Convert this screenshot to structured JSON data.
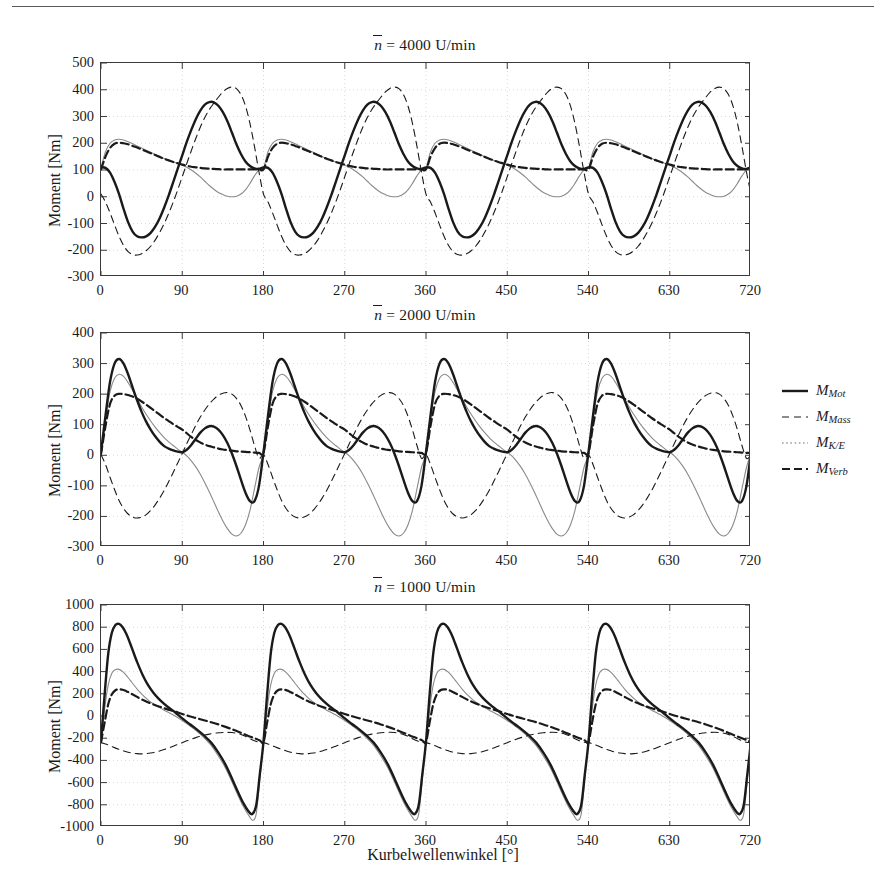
{
  "figure": {
    "x_axis_label": "Kurbelwellenwinkel [°]",
    "y_axis_label": "Moment [Nm]"
  },
  "legend": {
    "position": "right-middle",
    "entries": [
      {
        "name": "M_Mot",
        "base": "M",
        "sub": "Mot",
        "style": "solid",
        "color": "#1a1a1a",
        "width": 2.4
      },
      {
        "name": "M_Mass",
        "base": "M",
        "sub": "Mass",
        "style": "dashed",
        "color": "#1a1a1a",
        "width": 1.1
      },
      {
        "name": "M_K/E",
        "base": "M",
        "sub": "K/E",
        "style": "dotted",
        "color": "#6e6e6e",
        "width": 1.1
      },
      {
        "name": "M_Verb",
        "base": "M",
        "sub": "Verb",
        "style": "dashdot",
        "color": "#1a1a1a",
        "width": 2.2
      }
    ]
  },
  "chart_data": [
    {
      "id": "panel-4000",
      "type": "line",
      "title": "n̄ = 4000 U/min",
      "title_prefix": "n",
      "title_suffix": "= 4000 U/min",
      "speed_rpm": 4000,
      "xlabel": "Kurbelwellenwinkel [°]",
      "ylabel": "Moment [Nm]",
      "xlim": [
        0,
        720
      ],
      "ylim": [
        -300,
        500
      ],
      "xticks": [
        0,
        90,
        180,
        270,
        360,
        450,
        540,
        630,
        720
      ],
      "yticks": [
        -300,
        -200,
        -100,
        0,
        100,
        200,
        300,
        400,
        500
      ],
      "grid": true,
      "period_deg": 180,
      "series": [
        {
          "name": "M_Mot",
          "style": "solid",
          "color": "#1a1a1a",
          "width": 2.4,
          "x": [
            0,
            5,
            10,
            15,
            20,
            25,
            30,
            35,
            40,
            45,
            50,
            55,
            60,
            65,
            70,
            75,
            80,
            85,
            90,
            95,
            100,
            105,
            110,
            115,
            120,
            125,
            130,
            135,
            140,
            145,
            150,
            155,
            160,
            165,
            170,
            175,
            180
          ],
          "y": [
            110,
            108,
            90,
            55,
            10,
            -45,
            -95,
            -130,
            -148,
            -152,
            -148,
            -135,
            -112,
            -80,
            -40,
            5,
            55,
            105,
            155,
            205,
            250,
            290,
            322,
            344,
            354,
            353,
            340,
            316,
            282,
            240,
            196,
            160,
            132,
            115,
            106,
            104,
            110
          ]
        },
        {
          "name": "M_Mass",
          "style": "dashed",
          "color": "#1a1a1a",
          "width": 1.1,
          "x": [
            0,
            5,
            10,
            15,
            20,
            25,
            30,
            35,
            40,
            45,
            50,
            55,
            60,
            65,
            70,
            75,
            80,
            85,
            90,
            95,
            100,
            105,
            110,
            115,
            120,
            125,
            130,
            135,
            140,
            145,
            150,
            155,
            160,
            165,
            170,
            175,
            180
          ],
          "y": [
            10,
            -20,
            -60,
            -105,
            -148,
            -182,
            -205,
            -216,
            -218,
            -213,
            -202,
            -185,
            -162,
            -133,
            -100,
            -62,
            -20,
            26,
            75,
            124,
            172,
            218,
            260,
            296,
            326,
            350,
            372,
            392,
            405,
            410,
            404,
            382,
            340,
            274,
            188,
            92,
            10
          ]
        },
        {
          "name": "M_K/E",
          "style": "thin-solid",
          "color": "#8a8a8a",
          "width": 1.1,
          "x": [
            0,
            5,
            10,
            15,
            20,
            25,
            30,
            35,
            40,
            45,
            50,
            55,
            60,
            65,
            70,
            75,
            80,
            85,
            90,
            95,
            100,
            105,
            110,
            115,
            120,
            125,
            130,
            135,
            140,
            145,
            150,
            155,
            160,
            165,
            170,
            175,
            180
          ],
          "y": [
            108,
            168,
            200,
            212,
            215,
            212,
            206,
            198,
            190,
            182,
            174,
            166,
            158,
            150,
            143,
            136,
            130,
            124,
            118,
            110,
            100,
            88,
            74,
            58,
            42,
            28,
            16,
            8,
            2,
            0,
            2,
            10,
            26,
            50,
            78,
            100,
            108
          ]
        },
        {
          "name": "M_Verb",
          "style": "dashdot",
          "color": "#1a1a1a",
          "width": 2.2,
          "x": [
            0,
            5,
            10,
            15,
            20,
            25,
            30,
            35,
            40,
            45,
            50,
            55,
            60,
            65,
            70,
            75,
            80,
            85,
            90,
            95,
            100,
            105,
            110,
            115,
            120,
            125,
            130,
            135,
            140,
            145,
            150,
            155,
            160,
            165,
            170,
            175,
            180
          ],
          "y": [
            102,
            150,
            182,
            198,
            202,
            200,
            196,
            190,
            184,
            177,
            170,
            163,
            156,
            149,
            142,
            136,
            130,
            125,
            120,
            116,
            112,
            110,
            108,
            106,
            105,
            104,
            103,
            102,
            102,
            102,
            102,
            102,
            102,
            102,
            102,
            102,
            102
          ]
        }
      ]
    },
    {
      "id": "panel-2000",
      "type": "line",
      "title": "n̄ = 2000 U/min",
      "title_prefix": "n",
      "title_suffix": "= 2000 U/min",
      "speed_rpm": 2000,
      "xlabel": "Kurbelwellenwinkel [°]",
      "ylabel": "Moment [Nm]",
      "xlim": [
        0,
        720
      ],
      "ylim": [
        -300,
        400
      ],
      "xticks": [
        0,
        90,
        180,
        270,
        360,
        450,
        540,
        630,
        720
      ],
      "yticks": [
        -300,
        -200,
        -100,
        0,
        100,
        200,
        300,
        400
      ],
      "grid": true,
      "period_deg": 180,
      "series": [
        {
          "name": "M_Mot",
          "style": "solid",
          "color": "#1a1a1a",
          "width": 2.4,
          "x": [
            0,
            5,
            10,
            15,
            20,
            25,
            30,
            35,
            40,
            45,
            50,
            55,
            60,
            65,
            70,
            75,
            80,
            85,
            90,
            95,
            100,
            105,
            110,
            115,
            120,
            125,
            130,
            135,
            140,
            145,
            150,
            155,
            160,
            165,
            170,
            175,
            180
          ],
          "y": [
            10,
            130,
            240,
            300,
            315,
            300,
            265,
            222,
            180,
            142,
            110,
            84,
            62,
            44,
            30,
            22,
            16,
            12,
            10,
            18,
            34,
            54,
            74,
            88,
            95,
            94,
            84,
            66,
            40,
            6,
            -35,
            -80,
            -122,
            -150,
            -150,
            -100,
            10
          ]
        },
        {
          "name": "M_Mass",
          "style": "dashed",
          "color": "#1a1a1a",
          "width": 1.1,
          "x": [
            0,
            5,
            10,
            15,
            20,
            25,
            30,
            35,
            40,
            45,
            50,
            55,
            60,
            65,
            70,
            75,
            80,
            85,
            90,
            95,
            100,
            105,
            110,
            115,
            120,
            125,
            130,
            135,
            140,
            145,
            150,
            155,
            160,
            165,
            170,
            175,
            180
          ],
          "y": [
            2,
            -30,
            -72,
            -112,
            -148,
            -174,
            -192,
            -202,
            -205,
            -202,
            -194,
            -180,
            -162,
            -140,
            -115,
            -86,
            -56,
            -25,
            6,
            38,
            68,
            98,
            125,
            148,
            168,
            184,
            196,
            203,
            205,
            200,
            186,
            163,
            128,
            83,
            32,
            -10,
            2
          ]
        },
        {
          "name": "M_K/E",
          "style": "thin-solid",
          "color": "#8a8a8a",
          "width": 1.1,
          "x": [
            0,
            5,
            10,
            15,
            20,
            25,
            30,
            35,
            40,
            45,
            50,
            55,
            60,
            65,
            70,
            75,
            80,
            85,
            90,
            95,
            100,
            105,
            110,
            115,
            120,
            125,
            130,
            135,
            140,
            145,
            150,
            155,
            160,
            165,
            170,
            175,
            180
          ],
          "y": [
            6,
            118,
            208,
            252,
            265,
            258,
            238,
            212,
            185,
            158,
            134,
            112,
            92,
            74,
            58,
            44,
            32,
            20,
            10,
            -2,
            -18,
            -38,
            -62,
            -90,
            -120,
            -152,
            -185,
            -215,
            -240,
            -258,
            -264,
            -255,
            -228,
            -180,
            -110,
            -40,
            6
          ]
        },
        {
          "name": "M_Verb",
          "style": "dashdot",
          "color": "#1a1a1a",
          "width": 2.2,
          "x": [
            0,
            5,
            10,
            15,
            20,
            25,
            30,
            35,
            40,
            45,
            50,
            55,
            60,
            65,
            70,
            75,
            80,
            85,
            90,
            95,
            100,
            105,
            110,
            115,
            120,
            125,
            130,
            135,
            140,
            145,
            150,
            155,
            160,
            165,
            170,
            175,
            180
          ],
          "y": [
            4,
            96,
            168,
            195,
            201,
            200,
            197,
            192,
            185,
            176,
            166,
            155,
            144,
            133,
            122,
            112,
            102,
            93,
            84,
            72,
            60,
            50,
            42,
            35,
            30,
            26,
            22,
            19,
            17,
            15,
            13,
            12,
            11,
            10,
            9,
            8,
            8
          ]
        }
      ]
    },
    {
      "id": "panel-1000",
      "type": "line",
      "title": "n̄ = 1000 U/min",
      "title_prefix": "n",
      "title_suffix": "= 1000 U/min",
      "speed_rpm": 1000,
      "xlabel": "Kurbelwellenwinkel [°]",
      "ylabel": "Moment [Nm]",
      "xlim": [
        0,
        720
      ],
      "ylim": [
        -1000,
        1000
      ],
      "xticks": [
        0,
        90,
        180,
        270,
        360,
        450,
        540,
        630,
        720
      ],
      "yticks": [
        -1000,
        -800,
        -600,
        -400,
        -200,
        0,
        200,
        400,
        600,
        800,
        1000
      ],
      "grid": true,
      "period_deg": 180,
      "series": [
        {
          "name": "M_Mot",
          "style": "solid",
          "color": "#1a1a1a",
          "width": 2.4,
          "x": [
            0,
            4,
            8,
            12,
            16,
            20,
            24,
            28,
            32,
            36,
            40,
            46,
            52,
            58,
            64,
            70,
            76,
            82,
            90,
            98,
            106,
            114,
            122,
            130,
            138,
            146,
            152,
            158,
            164,
            168,
            172,
            176,
            180
          ],
          "y": [
            -230,
            190,
            560,
            750,
            820,
            830,
            800,
            740,
            660,
            572,
            486,
            372,
            280,
            210,
            155,
            110,
            70,
            34,
            -22,
            -72,
            -120,
            -175,
            -240,
            -330,
            -440,
            -580,
            -690,
            -790,
            -865,
            -880,
            -800,
            -520,
            -230
          ]
        },
        {
          "name": "M_Mass",
          "style": "dashed",
          "color": "#1a1a1a",
          "width": 1.1,
          "x": [
            0,
            5,
            10,
            15,
            20,
            25,
            30,
            35,
            40,
            45,
            50,
            55,
            60,
            65,
            70,
            75,
            80,
            85,
            90,
            95,
            100,
            105,
            110,
            115,
            120,
            125,
            130,
            135,
            140,
            145,
            150,
            155,
            160,
            165,
            170,
            175,
            180
          ],
          "y": [
            -240,
            -252,
            -268,
            -285,
            -300,
            -314,
            -326,
            -334,
            -339,
            -341,
            -339,
            -334,
            -326,
            -315,
            -302,
            -288,
            -272,
            -256,
            -240,
            -224,
            -209,
            -195,
            -183,
            -172,
            -163,
            -156,
            -151,
            -148,
            -147,
            -149,
            -155,
            -166,
            -183,
            -204,
            -224,
            -236,
            -240
          ]
        },
        {
          "name": "M_K/E",
          "style": "thin-solid",
          "color": "#8a8a8a",
          "width": 1.1,
          "x": [
            0,
            4,
            8,
            12,
            16,
            20,
            24,
            28,
            32,
            36,
            40,
            46,
            52,
            58,
            64,
            70,
            76,
            82,
            90,
            98,
            106,
            114,
            122,
            130,
            138,
            146,
            152,
            158,
            164,
            168,
            172,
            176,
            180
          ],
          "y": [
            -235,
            60,
            280,
            385,
            418,
            420,
            400,
            366,
            326,
            284,
            243,
            190,
            145,
            110,
            80,
            52,
            26,
            0,
            -40,
            -85,
            -135,
            -195,
            -265,
            -360,
            -470,
            -610,
            -720,
            -820,
            -900,
            -940,
            -880,
            -560,
            -235
          ]
        },
        {
          "name": "M_Verb",
          "style": "dashdot",
          "color": "#1a1a1a",
          "width": 2.2,
          "x": [
            0,
            4,
            8,
            12,
            16,
            20,
            24,
            28,
            32,
            36,
            40,
            46,
            52,
            58,
            64,
            70,
            76,
            82,
            90,
            98,
            106,
            114,
            122,
            130,
            138,
            146,
            154,
            162,
            170,
            176,
            180
          ],
          "y": [
            -235,
            -60,
            105,
            195,
            232,
            240,
            236,
            224,
            208,
            190,
            172,
            146,
            124,
            104,
            86,
            70,
            54,
            40,
            18,
            -2,
            -20,
            -38,
            -56,
            -76,
            -98,
            -122,
            -148,
            -175,
            -200,
            -220,
            -235
          ]
        }
      ]
    }
  ]
}
